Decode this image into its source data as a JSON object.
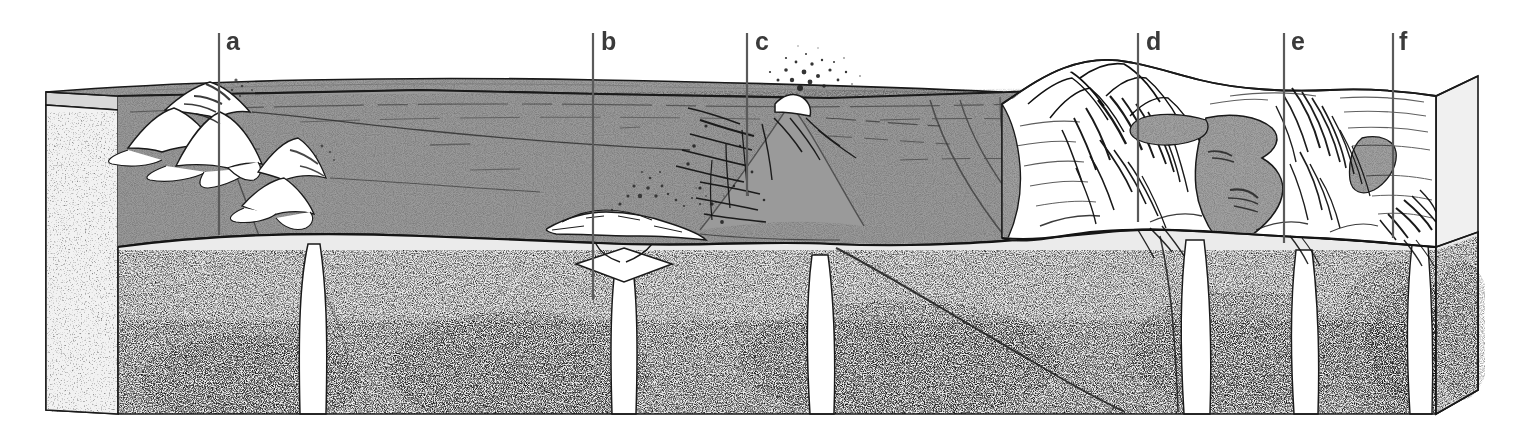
{
  "figure": {
    "kind": "geologic-block-diagram",
    "width": 1523,
    "height": 437
  },
  "labels": [
    {
      "id": "a",
      "text": "a",
      "x": 228,
      "y": 30,
      "line_x": 219,
      "line_top": 33,
      "line_bottom": 235,
      "feature": "volcanic-island-arc"
    },
    {
      "id": "b",
      "text": "b",
      "x": 605,
      "y": 30,
      "line_x": 593,
      "line_top": 33,
      "line_bottom": 300,
      "feature": "mid-ocean-ridge-spreading-center"
    },
    {
      "id": "c",
      "text": "c",
      "x": 759,
      "y": 30,
      "line_x": 747,
      "line_top": 33,
      "line_bottom": 196,
      "feature": "ocean-floor-volcano"
    },
    {
      "id": "d",
      "text": "d",
      "x": 1150,
      "y": 30,
      "line_x": 1138,
      "line_top": 33,
      "line_bottom": 222,
      "feature": "continental-mountain-belt"
    },
    {
      "id": "e",
      "text": "e",
      "x": 1295,
      "y": 30,
      "line_x": 1284,
      "line_top": 33,
      "line_bottom": 243,
      "feature": "continental-rift-inland-sea"
    },
    {
      "id": "f",
      "text": "f",
      "x": 1402,
      "y": 30,
      "line_x": 1393,
      "line_top": 33,
      "line_bottom": 238,
      "feature": "continental-fault-zone"
    }
  ],
  "palette": {
    "background": "#ffffff",
    "ocean_water": "#9c9c9c",
    "ocean_water_dark": "#8e8e8e",
    "inland_sea": "#a2a2a2",
    "mantle_base": "#e9e9e9",
    "mantle_speckle": "#1c1c1c",
    "side_face": "#efefef",
    "land_white": "#ffffff",
    "outline": "#1a1a1a",
    "label_text": "#3a3a3a",
    "leader_line": "#5a5a5a"
  },
  "regions": [
    {
      "name": "ocean-surface-top-face",
      "note": "gray sea surface forming the top of the block, seen in perspective"
    },
    {
      "name": "ocean-water-front-face",
      "note": "gray water column on the front cut face above the sea floor"
    },
    {
      "name": "mantle-front-face",
      "note": "light stippled mantle below the crust on the front cut face"
    },
    {
      "name": "left-side-face",
      "note": "light perspective side face at the left edge of the block"
    },
    {
      "name": "right-side-face",
      "note": "light perspective side face at the right edge of the block"
    }
  ],
  "features": [
    {
      "name": "island-arc-volcanoes",
      "label": "a",
      "note": "cluster of white volcanic cones rising above sea level"
    },
    {
      "name": "mid-ocean-ridge",
      "label": "b",
      "note": "ridge crest with rift and diamond-shaped magma chamber feeding from a deep conduit"
    },
    {
      "name": "seamount-volcano",
      "label": "c",
      "note": "erupting volcano with ash plume above sea level and feeder dykes below"
    },
    {
      "name": "fold-mountain-belt",
      "label": "d",
      "note": "white hatched mountain ranges on the continent"
    },
    {
      "name": "inland-sea-rift",
      "label": "e",
      "note": "gray inland water body within the continental interior"
    },
    {
      "name": "continental-fault",
      "label": "f",
      "note": "fault / ridge zone near the right edge of the continent"
    },
    {
      "name": "magma-conduits",
      "note": "white vertical pipes rising through the stippled mantle to the surface features"
    }
  ]
}
